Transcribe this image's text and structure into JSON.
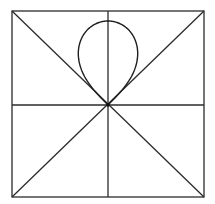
{
  "diagram": {
    "colors": {
      "background": "#ffffff",
      "line": "#2b2b2b",
      "curve": "#1f1f1f"
    },
    "square": {
      "x1": 12,
      "y1": 11,
      "x2": 204,
      "y2": 197
    },
    "center": {
      "x": 108,
      "y": 105
    },
    "curve": {
      "type": "lemniscate-lobe",
      "equation": "r^2 = a^2 cos(2φ), φ measured from vertical, |φ| ≤ 45°",
      "a_px": 84,
      "tangent_directions_deg": [
        45,
        135
      ]
    }
  }
}
